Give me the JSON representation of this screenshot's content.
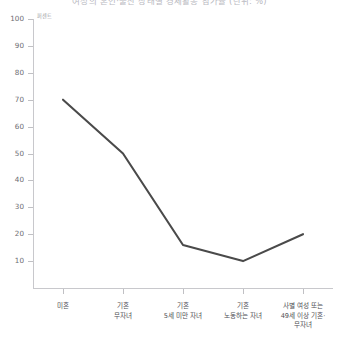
{
  "figure": {
    "cut_off_title": "여성의 혼인·출산 상태별 경제활동 참가율 (단위: %)",
    "axis_unit_label": "퍼센트"
  },
  "chart_data": {
    "type": "line",
    "title": "",
    "xlabel": "",
    "ylabel": "퍼센트",
    "ylim": [
      0,
      100
    ],
    "yticks": [
      10,
      20,
      30,
      40,
      50,
      60,
      70,
      80,
      90,
      100
    ],
    "ytick_labels": [
      "10",
      "20",
      "30",
      "40",
      "50",
      "60",
      "70",
      "80",
      "90",
      "100"
    ],
    "grid": false,
    "legend": "none",
    "line_color": "#4a4a4a",
    "categories": [
      "미혼",
      "기혼\n무자녀",
      "기혼\n5세 미만 자녀",
      "기혼\n노동하는 자녀",
      "사별 여성 또는\n49세 이상 기혼·\n무자녀"
    ],
    "values": [
      70,
      50,
      16,
      10,
      20
    ]
  }
}
